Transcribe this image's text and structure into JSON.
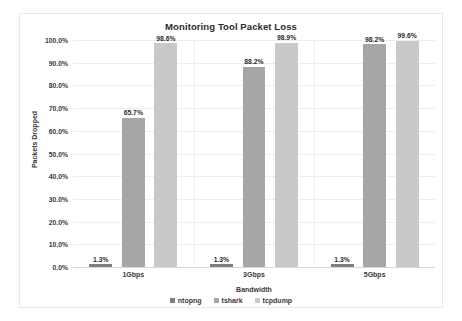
{
  "chart_data": {
    "type": "bar",
    "title": "Monitoring Tool Packet Loss",
    "xlabel": "Bandwidth",
    "ylabel": "Packets Dropped",
    "categories": [
      "1Gbps",
      "3Gbps",
      "5Gbps"
    ],
    "series": [
      {
        "name": "ntopng",
        "color": "#7f7f7f",
        "values": [
          1.3,
          1.3,
          1.3
        ],
        "labels": [
          "1.3%",
          "1.3%",
          "1.3%"
        ]
      },
      {
        "name": "tshark",
        "color": "#a6a6a6",
        "values": [
          65.7,
          88.2,
          98.2
        ],
        "labels": [
          "65.7%",
          "88.2%",
          "98.2%"
        ]
      },
      {
        "name": "tcpdump",
        "color": "#c9c9c9",
        "values": [
          98.6,
          98.9,
          99.6
        ],
        "labels": [
          "98.6%",
          "98.9%",
          "99.6%"
        ]
      }
    ],
    "ylim": [
      0,
      100
    ],
    "ytick_labels": [
      "100.0%",
      "90.0%",
      "80.0%",
      "70.0%",
      "60.0%",
      "50.0%",
      "40.0%",
      "30.0%",
      "20.0%",
      "10.0%",
      "0.0%"
    ],
    "ytick_values": [
      100,
      90,
      80,
      70,
      60,
      50,
      40,
      30,
      20,
      10,
      0
    ],
    "grid": true,
    "legend_position": "bottom"
  }
}
